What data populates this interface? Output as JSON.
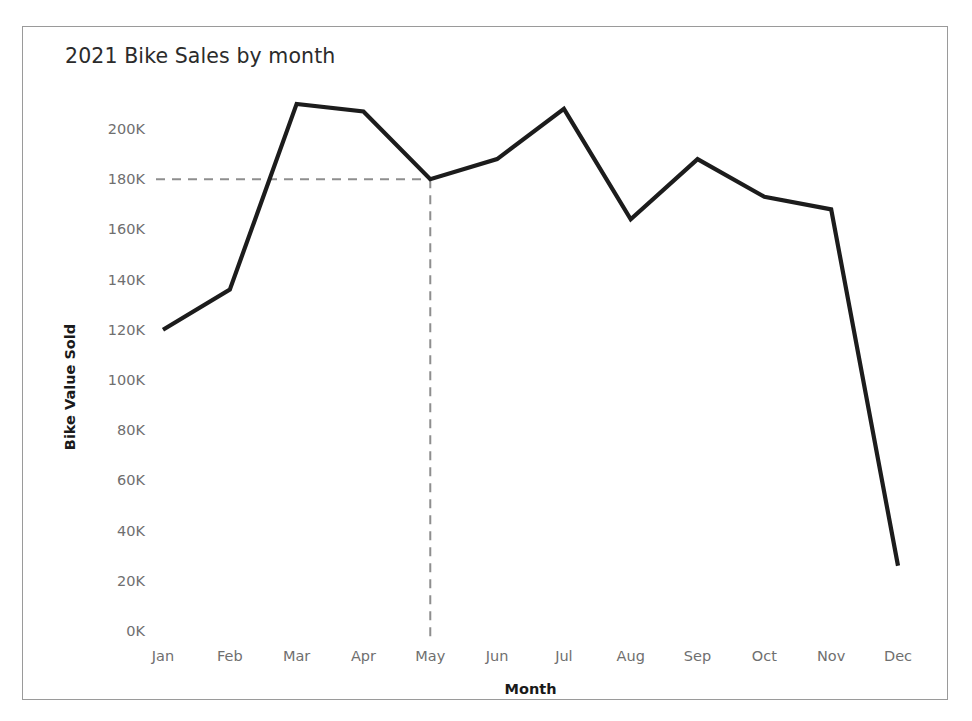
{
  "chart_data": {
    "type": "line",
    "title": "2021 Bike Sales by month",
    "xlabel": "Month",
    "ylabel": "Bike Value Sold",
    "categories": [
      "Jan",
      "Feb",
      "Mar",
      "Apr",
      "May",
      "Jun",
      "Jul",
      "Aug",
      "Sep",
      "Oct",
      "Nov",
      "Dec"
    ],
    "values": [
      120000,
      136000,
      210000,
      207000,
      180000,
      188000,
      208000,
      164000,
      188000,
      173000,
      168000,
      26000
    ],
    "series": [
      {
        "name": "Bike Value Sold",
        "values": [
          120000,
          136000,
          210000,
          207000,
          180000,
          188000,
          208000,
          164000,
          188000,
          173000,
          168000,
          26000
        ]
      }
    ],
    "ylim": [
      0,
      210000
    ],
    "y_tick_values": [
      0,
      20000,
      40000,
      60000,
      80000,
      100000,
      120000,
      140000,
      160000,
      180000,
      200000
    ],
    "y_tick_labels": [
      "0K",
      "20K",
      "40K",
      "60K",
      "80K",
      "100K",
      "120K",
      "140K",
      "160K",
      "180K",
      "200K"
    ],
    "grid": false,
    "legend": "none",
    "line_color": "#1c1c1c",
    "annotations": [
      {
        "name": "reference-lines",
        "type": "crosshair-dashed",
        "at_category": "May",
        "at_value": 180000,
        "color": "#8e8e8e",
        "style": "dashed"
      }
    ]
  },
  "axes": {
    "y_labels": [
      "200K",
      "180K",
      "160K",
      "140K",
      "120K",
      "100K",
      "80K",
      "60K",
      "40K",
      "20K",
      "0K"
    ],
    "x_labels": [
      "Jan",
      "Feb",
      "Mar",
      "Apr",
      "May",
      "Jun",
      "Jul",
      "Aug",
      "Sep",
      "Oct",
      "Nov",
      "Dec"
    ],
    "y_title": "Bike Value Sold",
    "x_title": "Month"
  },
  "header": {
    "title": "2021 Bike Sales by month"
  }
}
